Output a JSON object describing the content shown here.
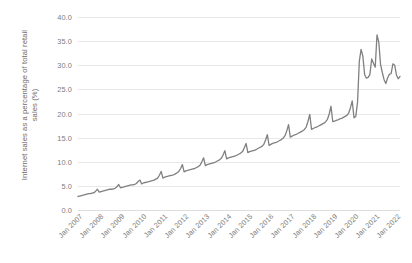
{
  "chart_data": {
    "type": "line",
    "title": "",
    "xlabel": "",
    "ylabel": "Internet sales as a percentage of total retail sales (%)",
    "ylabel_line1": "Internet sales as a percentage of total retail",
    "ylabel_line2": "sales (%)",
    "ylim": [
      0.0,
      40.0
    ],
    "ytick_step": 5.0,
    "ytick_labels": [
      "0.0",
      "5.0",
      "10.0",
      "15.0",
      "20.0",
      "25.0",
      "30.0",
      "35.0",
      "40.0"
    ],
    "ytick_values": [
      0.0,
      5.0,
      10.0,
      15.0,
      20.0,
      25.0,
      30.0,
      35.0,
      40.0
    ],
    "xtick_labels": [
      "Jan 2007",
      "Jan 2008",
      "Jan 2009",
      "Jan 2010",
      "Jan 2011",
      "Jan 2012",
      "Jan 2013",
      "Jan 2014",
      "Jan 2015",
      "Jan 2016",
      "Jan 2017",
      "Jan 2018",
      "Jan 2019",
      "Jan 2020",
      "Jan 2021",
      "Jan 2022"
    ],
    "xtick_rotation_degrees": 45,
    "grid": "horizontal",
    "legend": "none",
    "line_color": "#808080",
    "line_width_px": 1.3,
    "x_start": "Jan 2007",
    "x_end": "Mar 2022",
    "frequency": "monthly",
    "series": [
      {
        "name": "Internet sales as a percentage of total retail sales",
        "color": "#808080",
        "values": [
          2.8,
          2.9,
          3.0,
          3.1,
          3.2,
          3.3,
          3.4,
          3.4,
          3.5,
          3.6,
          3.9,
          4.3,
          3.7,
          3.8,
          3.9,
          4.0,
          4.1,
          4.2,
          4.3,
          4.3,
          4.4,
          4.5,
          4.8,
          5.3,
          4.6,
          4.7,
          4.8,
          4.9,
          5.0,
          5.1,
          5.2,
          5.2,
          5.3,
          5.5,
          5.9,
          6.2,
          5.4,
          5.6,
          5.7,
          5.8,
          5.9,
          6.0,
          6.1,
          6.2,
          6.4,
          6.6,
          7.2,
          8.0,
          6.6,
          6.8,
          6.9,
          7.0,
          7.1,
          7.2,
          7.3,
          7.5,
          7.7,
          8.0,
          8.6,
          9.4,
          7.9,
          8.1,
          8.2,
          8.3,
          8.4,
          8.5,
          8.6,
          8.8,
          9.0,
          9.3,
          10.0,
          10.8,
          9.2,
          9.4,
          9.5,
          9.6,
          9.7,
          9.8,
          10.0,
          10.2,
          10.4,
          10.7,
          11.4,
          12.3,
          10.6,
          10.8,
          10.9,
          11.0,
          11.1,
          11.2,
          11.4,
          11.6,
          11.8,
          12.1,
          12.9,
          13.8,
          11.9,
          12.1,
          12.2,
          12.3,
          12.4,
          12.6,
          12.8,
          13.0,
          13.2,
          13.6,
          14.5,
          15.6,
          13.4,
          13.6,
          13.8,
          13.9,
          14.0,
          14.2,
          14.4,
          14.6,
          14.9,
          15.4,
          16.4,
          17.7,
          15.1,
          15.3,
          15.5,
          15.6,
          15.8,
          16.0,
          16.2,
          16.4,
          16.7,
          17.2,
          18.4,
          19.8,
          16.7,
          16.9,
          17.1,
          17.2,
          17.4,
          17.6,
          17.8,
          18.0,
          18.3,
          18.8,
          19.9,
          21.5,
          18.3,
          18.4,
          18.6,
          18.7,
          18.9,
          19.0,
          19.2,
          19.4,
          19.6,
          20.1,
          21.2,
          22.6,
          19.1,
          19.4,
          22.3,
          30.8,
          33.3,
          31.9,
          28.1,
          27.3,
          27.5,
          28.1,
          31.3,
          30.4,
          29.6,
          36.3,
          34.8,
          30.2,
          28.5,
          27.0,
          26.2,
          27.4,
          28.1,
          28.3,
          30.3,
          30.0,
          28.0,
          27.2,
          27.7
        ]
      }
    ]
  }
}
